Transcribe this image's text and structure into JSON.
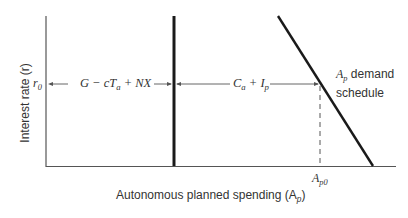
{
  "diagram": {
    "type": "economics-demand-schedule",
    "y_axis_label": "Interest rate (r)",
    "x_axis_label": "Autonomous planned spending (A",
    "x_axis_label_sub": "p",
    "x_axis_label_end": ")",
    "r_level": {
      "main": "r",
      "sub": "0"
    },
    "segment_left": {
      "text_a": "G − cT",
      "sub": "a",
      "text_b": " + NX"
    },
    "segment_right": {
      "text_a": "C",
      "sub1": "a",
      "text_b": " + I",
      "sub2": "p"
    },
    "demand_label": {
      "main": "A",
      "sub": "p",
      "rest": " demand",
      "line2": "schedule"
    },
    "x_tick": {
      "main": "A",
      "sub": "p0"
    },
    "colors": {
      "axis": "#555555",
      "line": "#1a1a1a",
      "text": "#333333"
    }
  }
}
